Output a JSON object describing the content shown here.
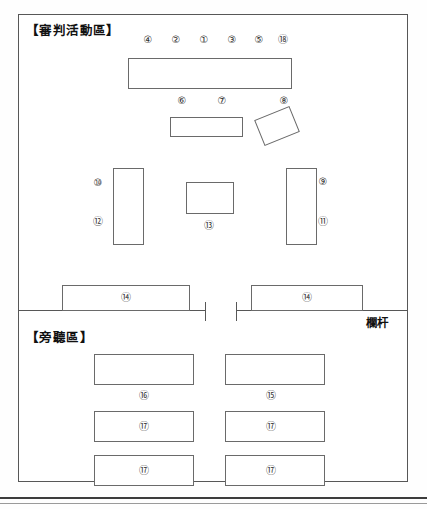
{
  "diagram": {
    "type": "floor-plan",
    "sections": [
      {
        "id": "trial",
        "title": "【審判活動區】"
      },
      {
        "id": "gallery",
        "title": "【旁聽區】"
      }
    ],
    "railing": {
      "label": "欄杆",
      "has_gate": true
    },
    "top_markers": [
      {
        "label": "④"
      },
      {
        "label": "②"
      },
      {
        "label": "①"
      },
      {
        "label": "③"
      },
      {
        "label": "⑤"
      },
      {
        "label": "⑱"
      }
    ],
    "second_row_markers": [
      {
        "label": "⑥"
      },
      {
        "label": "⑦"
      },
      {
        "label": "⑧"
      }
    ],
    "side_markers": [
      {
        "label": "⑩"
      },
      {
        "label": "⑫"
      },
      {
        "label": "⑨"
      },
      {
        "label": "⑪"
      }
    ],
    "center_marker": {
      "label": "⑬"
    },
    "bar_bench_markers": [
      {
        "label": "⑭"
      },
      {
        "label": "⑭"
      }
    ],
    "gallery_markers": [
      {
        "label": "⑯"
      },
      {
        "label": "⑮"
      },
      {
        "label": "⑰"
      },
      {
        "label": "⑰"
      },
      {
        "label": "⑰"
      },
      {
        "label": "⑰"
      }
    ]
  },
  "colors": {
    "frame": "#575757",
    "furniture_outline": "#6a6a6a",
    "text": "#111111",
    "page_rule": "#3d3d3d"
  }
}
